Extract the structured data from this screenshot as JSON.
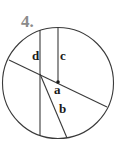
{
  "problem": {
    "number": "4."
  },
  "diagram": {
    "type": "circle-with-segments",
    "labels": {
      "a": "a",
      "b": "b",
      "c": "c",
      "d": "d"
    },
    "segments": [
      {
        "label": "a",
        "kind": "diameter"
      },
      {
        "label": "b",
        "kind": "chord"
      },
      {
        "label": "c",
        "kind": "radius"
      },
      {
        "label": "d",
        "kind": "chord"
      }
    ],
    "colors": {
      "line": "#3a3a3a",
      "label": "#1a1a1a",
      "number": "#8a8a8a"
    }
  }
}
